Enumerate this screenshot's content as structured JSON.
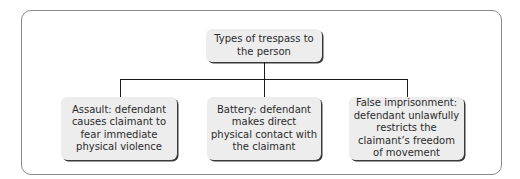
{
  "diagram": {
    "root": {
      "label": "Types of trespass to the person"
    },
    "children": [
      {
        "label": "Assault: defendant causes claimant to fear immediate physical violence"
      },
      {
        "label": "Battery: defendant makes direct physical contact with the claimant"
      },
      {
        "label": "False imprisonment: defendant unlawfully restricts the claimant’s freedom of movement"
      }
    ]
  }
}
